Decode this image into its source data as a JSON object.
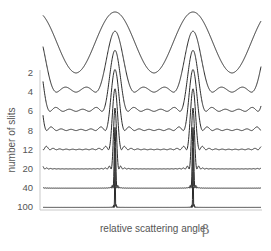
{
  "chart_data": {
    "type": "line",
    "title": "",
    "xlabel": "relative scattering angle",
    "xlabel_symbol": "β",
    "ylabel": "number of slits",
    "series_labels": [
      "2",
      "4",
      "6",
      "8",
      "12",
      "20",
      "40",
      "100"
    ],
    "series": [
      {
        "name": "2",
        "slits": 2
      },
      {
        "name": "4",
        "slits": 4
      },
      {
        "name": "6",
        "slits": 6
      },
      {
        "name": "8",
        "slits": 8
      },
      {
        "name": "12",
        "slits": 12
      },
      {
        "name": "20",
        "slits": 20
      },
      {
        "name": "40",
        "slits": 40
      },
      {
        "name": "100",
        "slits": 100
      }
    ],
    "x_range_periods": [
      -0.08,
      2.72
    ],
    "grid": false,
    "legend": "left"
  }
}
